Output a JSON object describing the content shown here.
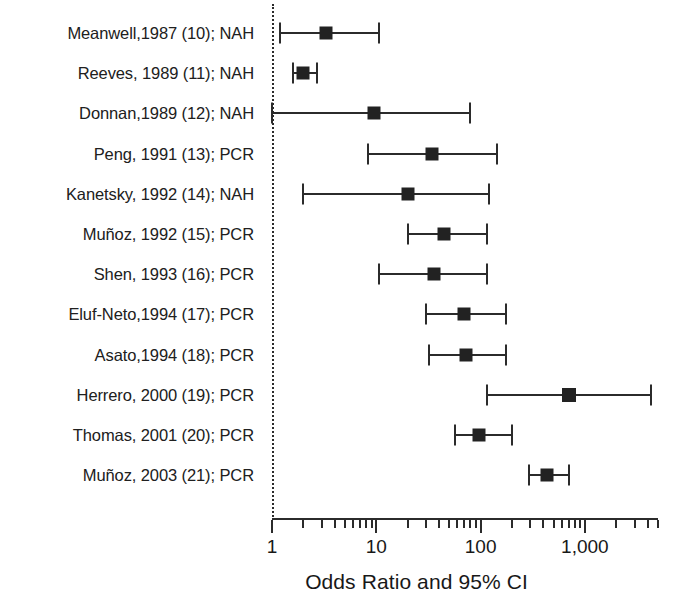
{
  "chart_data": {
    "type": "scatter",
    "subtype": "forest-plot",
    "title": "",
    "xlabel": "Odds Ratio and 95% CI",
    "ylabel": "",
    "xscale": "log",
    "xlim": [
      1,
      5000
    ],
    "grid": false,
    "legend": "none",
    "reference_line": 1,
    "x_ticks_major": [
      {
        "value": 1,
        "label": "1"
      },
      {
        "value": 10,
        "label": "10"
      },
      {
        "value": 100,
        "label": "100"
      },
      {
        "value": 1000,
        "label": "1,000"
      }
    ],
    "categories": [
      "Meanwell,1987 (10); NAH",
      "Reeves, 1989 (11); NAH",
      "Donnan,1989 (12); NAH",
      "Peng, 1991 (13); PCR",
      "Kanetsky, 1992 (14); NAH",
      "Muñoz, 1992 (15); PCR",
      "Shen, 1993 (16); PCR",
      "Eluf-Neto,1994 (17); PCR",
      "Asato,1994 (18); PCR",
      "Herrero, 2000 (19); PCR",
      "Thomas, 2001 (20); PCR",
      "Muñoz, 2003 (21); PCR"
    ],
    "points": [
      {
        "label": "Meanwell,1987 (10); NAH",
        "or": 3.3,
        "ci_low": 1.2,
        "ci_high": 10.5,
        "marker_size": 13,
        "left_clipped": false
      },
      {
        "label": "Reeves, 1989 (11); NAH",
        "or": 2.0,
        "ci_low": 1.6,
        "ci_high": 2.7,
        "marker_size": 13,
        "left_clipped": false
      },
      {
        "label": "Donnan,1989 (12); NAH",
        "or": 9.5,
        "ci_low": 1.0,
        "ci_high": 80,
        "marker_size": 13,
        "left_clipped": true
      },
      {
        "label": "Peng, 1991 (13); PCR",
        "or": 34,
        "ci_low": 8.3,
        "ci_high": 145,
        "marker_size": 13,
        "left_clipped": false
      },
      {
        "label": "Kanetsky, 1992 (14); NAH",
        "or": 20,
        "ci_low": 2.0,
        "ci_high": 120,
        "marker_size": 13,
        "left_clipped": false
      },
      {
        "label": "Muñoz, 1992 (15); PCR",
        "or": 45,
        "ci_low": 20,
        "ci_high": 115,
        "marker_size": 13,
        "left_clipped": false
      },
      {
        "label": "Shen, 1993 (16); PCR",
        "or": 36,
        "ci_low": 10.5,
        "ci_high": 115,
        "marker_size": 13,
        "left_clipped": false
      },
      {
        "label": "Eluf-Neto,1994 (17); PCR",
        "or": 69,
        "ci_low": 30,
        "ci_high": 175,
        "marker_size": 13,
        "left_clipped": false
      },
      {
        "label": "Asato,1994 (18); PCR",
        "or": 73,
        "ci_low": 32,
        "ci_high": 175,
        "marker_size": 13,
        "left_clipped": false
      },
      {
        "label": "Herrero, 2000 (19); PCR",
        "or": 700,
        "ci_low": 115,
        "ci_high": 4300,
        "marker_size": 14,
        "left_clipped": false
      },
      {
        "label": "Thomas, 2001 (20); PCR",
        "or": 96,
        "ci_low": 57,
        "ci_high": 200,
        "marker_size": 13,
        "left_clipped": false
      },
      {
        "label": "Muñoz, 2003 (21); PCR",
        "or": 430,
        "ci_low": 290,
        "ci_high": 700,
        "marker_size": 13,
        "left_clipped": false
      }
    ]
  }
}
